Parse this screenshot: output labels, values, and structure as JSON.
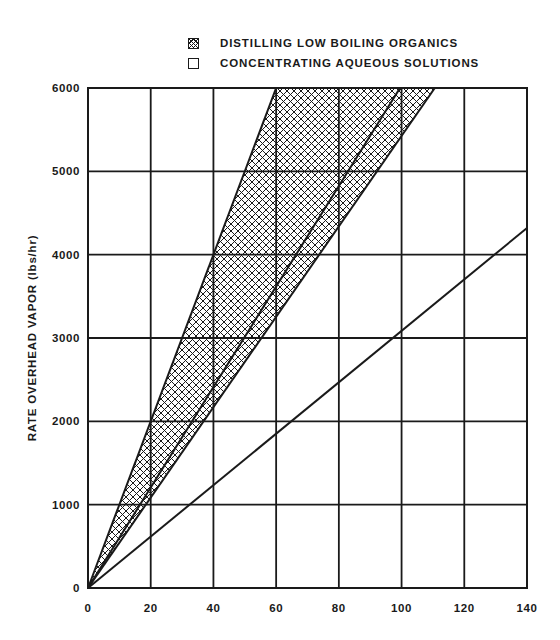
{
  "chart_data": {
    "type": "line",
    "title": "",
    "xlabel": "",
    "ylabel": "RATE OVERHEAD VAPOR (lbs/hr)",
    "xlim": [
      0,
      140
    ],
    "ylim": [
      0,
      6000
    ],
    "grid": true,
    "legend_position": "top",
    "x_ticks": [
      "0",
      "20",
      "40",
      "60",
      "80",
      "100",
      "120",
      "140"
    ],
    "y_ticks": [
      "0",
      "1000",
      "2000",
      "3000",
      "4000",
      "5000",
      "6000"
    ],
    "legend": [
      {
        "label": "DISTILLING LOW BOILING ORGANICS",
        "style": "crosshatched"
      },
      {
        "label": "CONCENTRATING AQUEOUS SOLUTIONS",
        "style": "open"
      }
    ],
    "series": [
      {
        "name": "Organics band upper bound",
        "x": [
          0,
          60
        ],
        "y": [
          0,
          6000
        ]
      },
      {
        "name": "Organics band inner line",
        "x": [
          0,
          99.5
        ],
        "y": [
          0,
          6000
        ]
      },
      {
        "name": "Organics band lower bound",
        "x": [
          0,
          110.6
        ],
        "y": [
          0,
          6000
        ]
      },
      {
        "name": "Aqueous solutions",
        "x": [
          0,
          140
        ],
        "y": [
          0,
          4320
        ]
      }
    ],
    "shaded_region": {
      "series": "DISTILLING LOW BOILING ORGANICS",
      "between": [
        "Organics band upper bound",
        "Organics band lower bound"
      ],
      "pattern": "crosshatch"
    }
  },
  "legend": {
    "items": [
      {
        "label": "DISTILLING LOW BOILING ORGANICS"
      },
      {
        "label": "CONCENTRATING AQUEOUS SOLUTIONS"
      }
    ]
  },
  "axes": {
    "ylabel": "RATE OVERHEAD VAPOR (lbs/hr)",
    "x_ticks": [
      "0",
      "20",
      "40",
      "60",
      "80",
      "100",
      "120",
      "140"
    ],
    "y_ticks": [
      "0",
      "1000",
      "2000",
      "3000",
      "4000",
      "5000",
      "6000"
    ]
  }
}
